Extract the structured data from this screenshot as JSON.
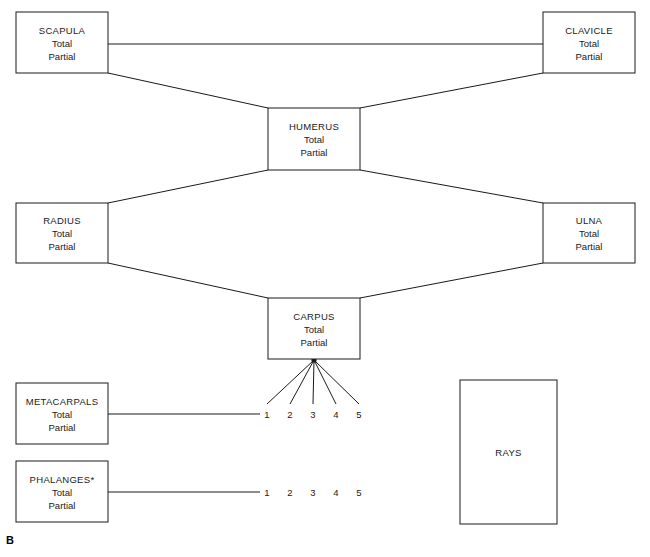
{
  "figure": {
    "panel_label": "B",
    "width": 650,
    "height": 557,
    "line_color": "#1a1a1a",
    "background_color": "#ffffff"
  },
  "boxes": [
    {
      "id": "scapula",
      "title": "SCAPULA",
      "line2": "Total",
      "line3": "Partial",
      "x": 16,
      "y": 12,
      "w": 92,
      "h": 61
    },
    {
      "id": "clavicle",
      "title": "CLAVICLE",
      "line2": "Total",
      "line3": "Partial",
      "x": 543,
      "y": 12,
      "w": 92,
      "h": 61
    },
    {
      "id": "humerus",
      "title": "HUMERUS",
      "line2": "Total",
      "line3": "Partial",
      "x": 268,
      "y": 108,
      "w": 92,
      "h": 62
    },
    {
      "id": "radius",
      "title": "RADIUS",
      "line2": "Total",
      "line3": "Partial",
      "x": 16,
      "y": 203,
      "w": 92,
      "h": 60
    },
    {
      "id": "ulna",
      "title": "ULNA",
      "line2": "Total",
      "line3": "Partial",
      "x": 543,
      "y": 203,
      "w": 92,
      "h": 60
    },
    {
      "id": "carpus",
      "title": "CARPUS",
      "line2": "Total",
      "line3": "Partial",
      "x": 268,
      "y": 298,
      "w": 92,
      "h": 61
    },
    {
      "id": "metacarpals",
      "title": "METACARPALS",
      "line2": "Total",
      "line3": "Partial",
      "x": 16,
      "y": 383,
      "w": 92,
      "h": 61
    },
    {
      "id": "phalanges",
      "title": "PHALANGES*",
      "line2": "Total",
      "line3": "Partial",
      "x": 16,
      "y": 461,
      "w": 92,
      "h": 61
    },
    {
      "id": "rays",
      "title": "RAYS",
      "line2": "",
      "line3": "",
      "x": 460,
      "y": 380,
      "w": 97,
      "h": 144
    }
  ],
  "connectors": [
    {
      "id": "scapula-clavicle",
      "x1": 108,
      "y1": 44,
      "x2": 543,
      "y2": 44
    },
    {
      "id": "scapula-humerus",
      "x1": 108,
      "y1": 73,
      "x2": 268,
      "y2": 108
    },
    {
      "id": "clavicle-humerus",
      "x1": 543,
      "y1": 73,
      "x2": 360,
      "y2": 108
    },
    {
      "id": "humerus-radius",
      "x1": 268,
      "y1": 170,
      "x2": 108,
      "y2": 203
    },
    {
      "id": "humerus-ulna",
      "x1": 360,
      "y1": 170,
      "x2": 543,
      "y2": 203
    },
    {
      "id": "radius-carpus",
      "x1": 108,
      "y1": 263,
      "x2": 268,
      "y2": 298
    },
    {
      "id": "ulna-carpus",
      "x1": 543,
      "y1": 263,
      "x2": 360,
      "y2": 298
    },
    {
      "id": "metacarpals-digits",
      "x1": 108,
      "y1": 414,
      "x2": 260,
      "y2": 414
    },
    {
      "id": "phalanges-digits",
      "x1": 108,
      "y1": 492,
      "x2": 260,
      "y2": 492
    }
  ],
  "ray_fan": {
    "origin_x": 314,
    "origin_y": 360,
    "endpoints": [
      {
        "x": 267,
        "y": 404
      },
      {
        "x": 290,
        "y": 404
      },
      {
        "x": 313,
        "y": 404
      },
      {
        "x": 336,
        "y": 404
      },
      {
        "x": 359,
        "y": 404
      }
    ]
  },
  "digit_rows": [
    {
      "id": "metacarpal-digits",
      "y": 418,
      "digits": [
        {
          "label": "1",
          "x": 267
        },
        {
          "label": "2",
          "x": 290
        },
        {
          "label": "3",
          "x": 313
        },
        {
          "label": "4",
          "x": 336
        },
        {
          "label": "5",
          "x": 359
        }
      ]
    },
    {
      "id": "phalangeal-digits",
      "y": 496,
      "digits": [
        {
          "label": "1",
          "x": 267
        },
        {
          "label": "2",
          "x": 290
        },
        {
          "label": "3",
          "x": 313
        },
        {
          "label": "4",
          "x": 336
        },
        {
          "label": "5",
          "x": 359
        }
      ]
    }
  ]
}
